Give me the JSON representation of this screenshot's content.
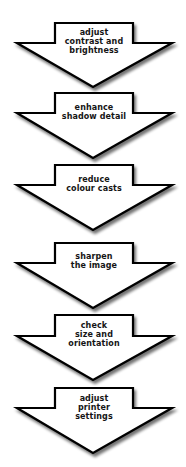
{
  "diagram": {
    "type": "vertical-process-flow",
    "colors": {
      "fill": "#ffffff",
      "stroke": "#000000",
      "text": "#151515",
      "shadow": "#9a9a9a"
    },
    "steps": [
      {
        "lines": [
          "adjust",
          "contrast and",
          "brightness"
        ]
      },
      {
        "lines": [
          "enhance",
          "shadow detail"
        ]
      },
      {
        "lines": [
          "reduce",
          "colour casts"
        ]
      },
      {
        "lines": [
          "sharpen",
          "the image"
        ]
      },
      {
        "lines": [
          "check",
          "size and",
          "orientation"
        ]
      },
      {
        "lines": [
          "adjust",
          "printer",
          "settings"
        ]
      }
    ]
  }
}
